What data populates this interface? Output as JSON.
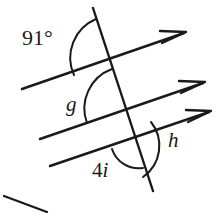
{
  "figure": {
    "kind": "geometry-diagram",
    "width": 218,
    "height": 213,
    "stroke_color": "#1a1a1a",
    "background_color": "#ffffff"
  },
  "labels": {
    "angle_top": "91°",
    "angle_middle": "g",
    "angle_bottom_left": "4",
    "angle_bottom_left_var": "i",
    "angle_bottom_right": "h"
  },
  "icons": {
    "arrow_top": "parallel-arrow-icon",
    "arrow_middle": "parallel-arrow-icon",
    "arrow_bottom": "parallel-arrow-icon"
  },
  "geometry": {
    "transversal": {
      "x1": 93,
      "y1": 8,
      "x2": 153,
      "y2": 191
    },
    "parallel_lines": [
      {
        "name": "line-top",
        "x1": 22,
        "y1": 89,
        "x2": 186,
        "y2": 32
      },
      {
        "name": "line-middle",
        "x1": 40,
        "y1": 139,
        "x2": 205,
        "y2": 82
      },
      {
        "name": "line-bottom",
        "x1": 50,
        "y1": 166,
        "x2": 211,
        "y2": 111
      }
    ],
    "intersections": [
      {
        "name": "intersection-top",
        "x": 110,
        "y": 58
      },
      {
        "name": "intersection-middle",
        "x": 126,
        "y": 108
      },
      {
        "name": "intersection-bottom",
        "x": 138,
        "y": 140
      }
    ],
    "stray_mark": {
      "x1": 4,
      "y1": 196,
      "x2": 47,
      "y2": 212
    }
  }
}
